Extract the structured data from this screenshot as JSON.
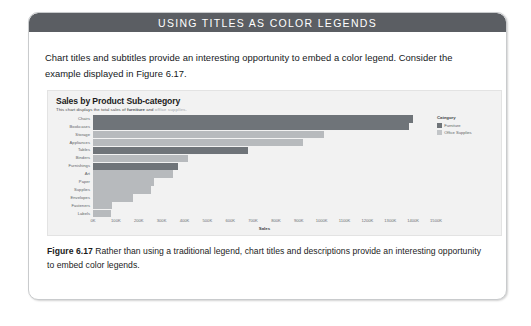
{
  "callout": {
    "header_title": "USING TITLES AS COLOR LEGENDS",
    "intro": "Chart titles and subtitles provide an interesting opportunity to embed a color legend. Consider the example displayed in Figure 6.17."
  },
  "figure": {
    "caption_label": "Figure 6.17",
    "caption_text": "Rather than using a traditional legend, chart titles and descriptions provide an interesting opportunity to embed color legends."
  },
  "colors": {
    "header_bg": "#5b5e63",
    "furniture": "#6f7479",
    "office_supplies": "#b7babd",
    "panel_bg": "#f2f2f2"
  },
  "chart_data": {
    "type": "bar",
    "orientation": "horizontal",
    "title": "Sales by Product Sub-category",
    "subtitle_parts": [
      {
        "text": "This chart displays the total sales of ",
        "style": "plain"
      },
      {
        "text": "furniture",
        "style": "furniture"
      },
      {
        "text": " and ",
        "style": "plain"
      },
      {
        "text": "office supplies",
        "style": "office"
      },
      {
        "text": ".",
        "style": "plain"
      }
    ],
    "subtitle": "This chart displays the total sales of furniture and office supplies.",
    "xlabel": "Sales",
    "ylabel": "",
    "xlim": [
      0,
      1500
    ],
    "xunit": "K",
    "xticks": [
      "0K",
      "100K",
      "200K",
      "300K",
      "400K",
      "500K",
      "600K",
      "700K",
      "800K",
      "900K",
      "1000K",
      "1100K",
      "1200K",
      "1300K",
      "1400K",
      "1500K"
    ],
    "xtick_values": [
      0,
      100,
      200,
      300,
      400,
      500,
      600,
      700,
      800,
      900,
      1000,
      1100,
      1200,
      1300,
      1400,
      1500
    ],
    "grid": false,
    "legend": {
      "title": "Category",
      "position": "right",
      "entries": [
        {
          "label": "Furniture",
          "color": "#6f7479"
        },
        {
          "label": "Office Supplies",
          "color": "#c2c5c8"
        }
      ]
    },
    "categories": [
      "Chairs",
      "Bookcases",
      "Storage",
      "Appliances",
      "Tables",
      "Binders",
      "Furnishings",
      "Art",
      "Paper",
      "Supplies",
      "Envelopes",
      "Fasteners",
      "Labels"
    ],
    "bars": [
      {
        "category": "Chairs",
        "value": 1400,
        "series": "Furniture"
      },
      {
        "category": "Bookcases",
        "value": 1380,
        "series": "Furniture"
      },
      {
        "category": "Storage",
        "value": 1010,
        "series": "Office Supplies"
      },
      {
        "category": "Appliances",
        "value": 920,
        "series": "Office Supplies"
      },
      {
        "category": "Tables",
        "value": 680,
        "series": "Furniture"
      },
      {
        "category": "Binders",
        "value": 415,
        "series": "Office Supplies"
      },
      {
        "category": "Furnishings",
        "value": 370,
        "series": "Furniture"
      },
      {
        "category": "Art",
        "value": 350,
        "series": "Office Supplies"
      },
      {
        "category": "Paper",
        "value": 265,
        "series": "Office Supplies"
      },
      {
        "category": "Supplies",
        "value": 255,
        "series": "Office Supplies"
      },
      {
        "category": "Envelopes",
        "value": 175,
        "series": "Office Supplies"
      },
      {
        "category": "Fasteners",
        "value": 85,
        "series": "Office Supplies"
      },
      {
        "category": "Labels",
        "value": 80,
        "series": "Office Supplies"
      }
    ]
  }
}
